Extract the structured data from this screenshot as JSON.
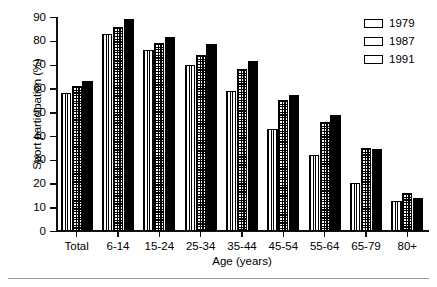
{
  "chart_data": {
    "type": "bar",
    "title": "",
    "xlabel": "Age (years)",
    "ylabel": "Sport participation (%)",
    "categories": [
      "Total",
      "6-14",
      "15-24",
      "25-34",
      "35-44",
      "45-54",
      "55-64",
      "65-79",
      "80+"
    ],
    "ylim": [
      0,
      90
    ],
    "yticks": [
      0,
      10,
      20,
      30,
      40,
      50,
      60,
      70,
      80,
      90
    ],
    "ytick_labels": [
      "0",
      "10",
      "20",
      "30",
      "40",
      "50",
      "60",
      "70",
      "80",
      "90"
    ],
    "grid": false,
    "legend_position": "top-right",
    "series": [
      {
        "name": "1979",
        "pattern": "vertical-stripes",
        "values": [
          58,
          83,
          76,
          70,
          59,
          43,
          32,
          20,
          12.5
        ]
      },
      {
        "name": "1987",
        "pattern": "crosshatch-grid",
        "values": [
          61,
          86,
          79,
          74,
          68,
          55,
          46,
          35,
          16
        ]
      },
      {
        "name": "1991",
        "pattern": "solid-black",
        "values": [
          63,
          89,
          81.5,
          78.5,
          71.5,
          57,
          49,
          34.5,
          14
        ]
      }
    ]
  },
  "legend": {
    "entries": [
      {
        "label": "1979"
      },
      {
        "label": "1987"
      },
      {
        "label": "1991"
      }
    ]
  },
  "colors": {
    "ink": "#000000",
    "background": "#ffffff",
    "rule": "#9a9a9a"
  }
}
